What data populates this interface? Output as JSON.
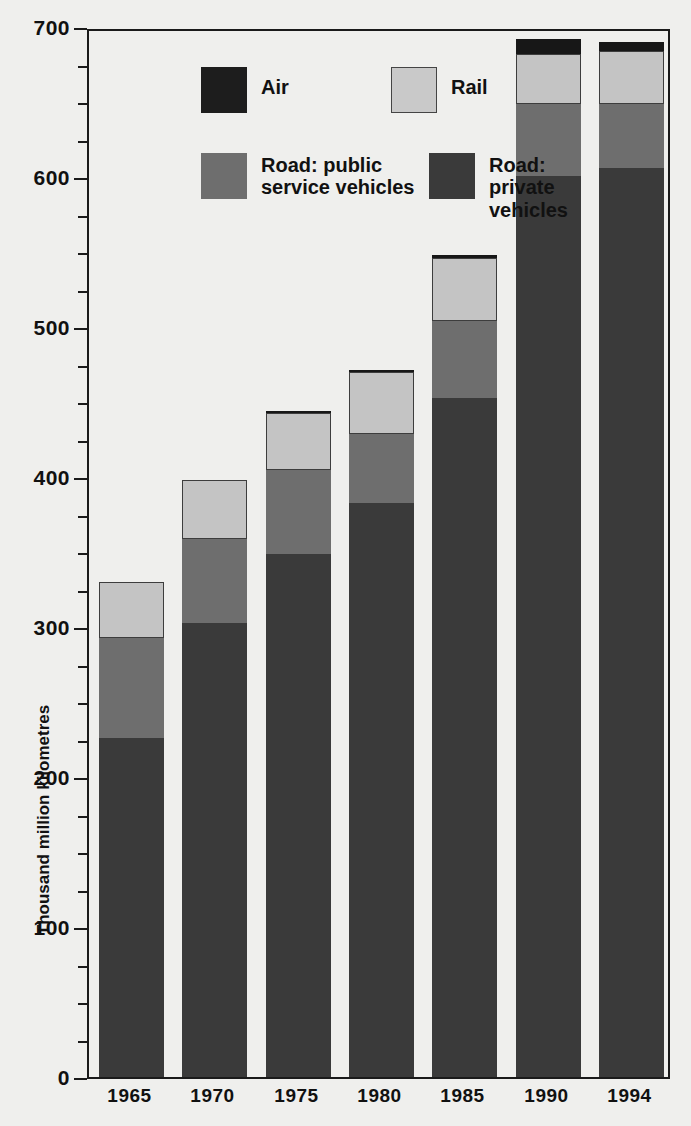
{
  "chart_data": {
    "type": "bar",
    "subtype": "stacked-bar",
    "title": "",
    "xlabel": "",
    "ylabel": "Thousand million kilometres",
    "ylim": [
      0,
      700
    ],
    "ytick_labels": [
      "0",
      "100",
      "200",
      "300",
      "400",
      "500",
      "600",
      "700"
    ],
    "ytick_values": [
      0,
      100,
      200,
      300,
      400,
      500,
      600,
      700
    ],
    "yminor_step": 25,
    "grid": false,
    "legend_position": "top-left-inside",
    "categories": [
      "1965",
      "1970",
      "1975",
      "1980",
      "1985",
      "1990",
      "1994"
    ],
    "series": [
      {
        "name": "Road: private vehicles",
        "color": "#3a3a3a",
        "values": [
          226,
          303,
          349,
          383,
          453,
          601,
          606
        ]
      },
      {
        "name": "Road: public service vehicles",
        "color": "#6e6e6e",
        "values": [
          67,
          56,
          56,
          46,
          51,
          48,
          43
        ]
      },
      {
        "name": "Rail",
        "color": "#c4c4c4",
        "values": [
          37,
          39,
          38,
          41,
          42,
          33,
          35
        ]
      },
      {
        "name": "Air",
        "color": "#171717",
        "values": [
          0,
          0,
          1,
          1,
          2,
          10,
          6
        ]
      }
    ],
    "totals": [
      330,
      398,
      443,
      470,
      546,
      692,
      690
    ]
  },
  "legend": {
    "items": [
      {
        "label": "Air",
        "swatch": "sw-air",
        "name": "legend-air"
      },
      {
        "label": "Rail",
        "swatch": "sw-rail",
        "name": "legend-rail"
      },
      {
        "label": "Road: public\nservice vehicles",
        "swatch": "sw-public",
        "name": "legend-road-public"
      },
      {
        "label": "Road: private\nvehicles",
        "swatch": "sw-private",
        "name": "legend-road-private"
      }
    ]
  }
}
